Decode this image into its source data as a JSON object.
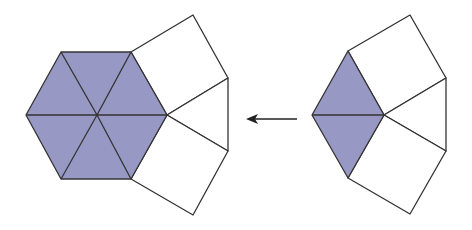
{
  "diagram": {
    "colors": {
      "fill": "#9898c4",
      "stroke": "#333333",
      "square_fill": "#ffffff",
      "arrow": "#222222"
    },
    "left_figure": {
      "hexagon_vertices": [
        [
          26,
          115
        ],
        [
          61,
          52
        ],
        [
          131,
          52
        ],
        [
          167,
          115
        ],
        [
          131,
          179
        ],
        [
          61,
          179
        ]
      ],
      "center": [
        97,
        115
      ],
      "triangle_count": 6,
      "squares": [
        [
          [
            131,
            52
          ],
          [
            193,
            15
          ],
          [
            228,
            78
          ],
          [
            167,
            115
          ]
        ],
        [
          [
            167,
            115
          ],
          [
            228,
            78
          ],
          [
            228,
            151
          ]
        ],
        [
          [
            167,
            115
          ],
          [
            228,
            151
          ],
          [
            193,
            215
          ],
          [
            131,
            179
          ]
        ]
      ]
    },
    "right_figure": {
      "rhombus_vertices": [
        [
          312,
          115
        ],
        [
          348,
          51
        ],
        [
          384,
          115
        ],
        [
          348,
          178
        ]
      ],
      "triangle_count": 2,
      "squares": [
        [
          [
            348,
            51
          ],
          [
            410,
            15
          ],
          [
            446,
            78
          ],
          [
            384,
            115
          ]
        ],
        [
          [
            384,
            115
          ],
          [
            446,
            78
          ],
          [
            446,
            151
          ]
        ],
        [
          [
            384,
            115
          ],
          [
            446,
            151
          ],
          [
            410,
            214
          ],
          [
            348,
            178
          ]
        ]
      ]
    },
    "arrow": {
      "from": [
        297,
        119
      ],
      "to": [
        246,
        119
      ],
      "direction": "left"
    }
  }
}
